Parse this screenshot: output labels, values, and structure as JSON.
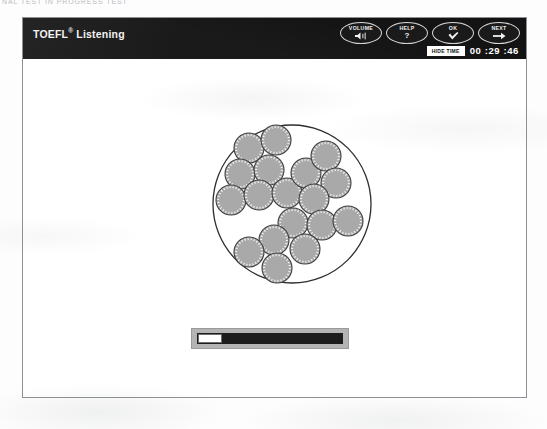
{
  "scan_artifact": {
    "top_text": "NAL TEST  IN PROGRESS TEST"
  },
  "window": {
    "header": {
      "title_main": "TOEFL",
      "title_sup": "®",
      "title_rest": " Listening",
      "buttons": [
        {
          "label": "VOLUME",
          "icon": "speaker-icon"
        },
        {
          "label": "HELP",
          "icon": "question-mark-icon"
        },
        {
          "label": "OK",
          "icon": "checkmark-icon"
        },
        {
          "label": "NEXT",
          "icon": "arrow-right-icon"
        }
      ],
      "hide_time_label": "HIDE TIME",
      "timer": "00 :29 :46"
    },
    "content": {
      "figure": {
        "type": "microscope-field-illustration",
        "description": "Circular microscope field of view containing round gray cells",
        "field_circle": {
          "cx": 83,
          "cy": 83,
          "r": 79
        },
        "cell_radius": 15,
        "cell_fill": "#a9a9a9",
        "cell_stroke": "#3f3f3f",
        "cells": [
          {
            "cx": 40,
            "cy": 27
          },
          {
            "cx": 67,
            "cy": 19
          },
          {
            "cx": 31,
            "cy": 53
          },
          {
            "cx": 60,
            "cy": 49
          },
          {
            "cx": 22,
            "cy": 79
          },
          {
            "cx": 50,
            "cy": 74
          },
          {
            "cx": 78,
            "cy": 72
          },
          {
            "cx": 97,
            "cy": 52
          },
          {
            "cx": 117,
            "cy": 35
          },
          {
            "cx": 127,
            "cy": 62
          },
          {
            "cx": 105,
            "cy": 78
          },
          {
            "cx": 84,
            "cy": 102
          },
          {
            "cx": 113,
            "cy": 104
          },
          {
            "cx": 139,
            "cy": 100
          },
          {
            "cx": 65,
            "cy": 119
          },
          {
            "cx": 96,
            "cy": 128
          },
          {
            "cx": 40,
            "cy": 131
          },
          {
            "cx": 68,
            "cy": 147
          }
        ]
      },
      "audio_player": {
        "name": "audio-progress-bar",
        "progress_percent": 0
      }
    }
  },
  "colors": {
    "header_bg": "#131313",
    "panel_border": "#8c8f93",
    "cell_fill": "#a9a9a9",
    "track": "#1c1c1c",
    "bar_frame": "#b4b4b4"
  }
}
